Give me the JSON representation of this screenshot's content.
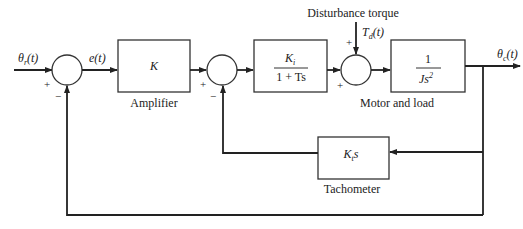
{
  "diagram": {
    "type": "block-diagram",
    "signals": {
      "input": "θr(t)",
      "input_main": "θ",
      "input_sub": "r",
      "input_arg": "(t)",
      "error": "e(t)",
      "output_main": "θ",
      "output_sub": "c",
      "output_arg": "(t)",
      "disturbance_main": "T",
      "disturbance_sub": "d",
      "disturbance_arg": "(t)",
      "disturbance_label": "Disturbance torque"
    },
    "blocks": {
      "amplifier": {
        "tf": "K",
        "label": "Amplifier"
      },
      "motor_gain": {
        "numerator_main": "K",
        "numerator_sub": "i",
        "denominator": "1 + Ts"
      },
      "plant": {
        "numerator": "1",
        "denominator_main": "Js",
        "denominator_exp": "2"
      },
      "motor_label": "Motor and load",
      "tachometer": {
        "tf_main": "K",
        "tf_sub": "t",
        "tf_s": "s",
        "label": "Tachometer"
      }
    },
    "junctions": {
      "j1": {
        "plus": "+",
        "minus": "−"
      },
      "j2": {
        "plus": "+",
        "minus": "−"
      },
      "j3": {
        "plus_left": "+",
        "plus_top": "+"
      }
    }
  }
}
